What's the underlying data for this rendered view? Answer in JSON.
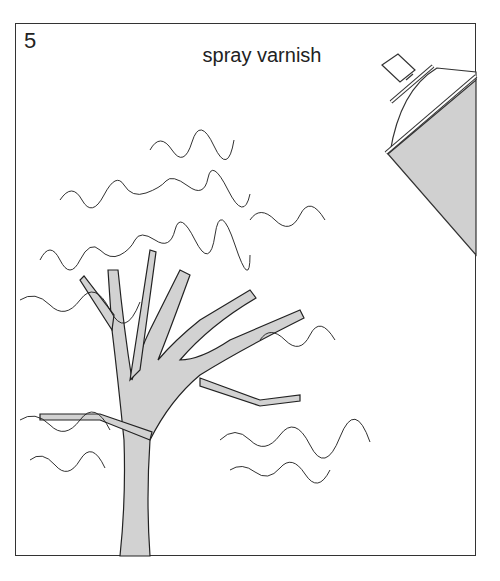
{
  "illustration": {
    "step_number": "5",
    "caption": "spray varnish",
    "subject": "pen-and-ink tree drawing",
    "icons": [
      "spray-can-icon",
      "tree-illustration"
    ],
    "colors": {
      "frame": "#333333",
      "ink": "#1a1a1a",
      "shade": "#cfcfcf",
      "background": "#ffffff"
    }
  }
}
